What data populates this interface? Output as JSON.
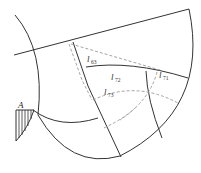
{
  "diagram": {
    "type": "geometric-construction",
    "point_labels": [
      {
        "id": "A",
        "text": "A"
      }
    ],
    "segment_labels": [
      {
        "id": "l63",
        "main": "l",
        "sub": "63"
      },
      {
        "id": "l72",
        "main": "l",
        "sub": "72"
      },
      {
        "id": "l73",
        "main": "l",
        "sub": "73"
      },
      {
        "id": "l71",
        "main": "l",
        "sub": "71"
      }
    ],
    "colors": {
      "line": "#333333",
      "dashed": "#9a9a9a",
      "background": "#ffffff"
    }
  }
}
